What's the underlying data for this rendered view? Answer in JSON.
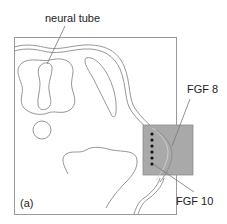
{
  "figure": {
    "panel_label": "(a)",
    "labels": {
      "neural_tube": "neural tube",
      "fgf8": "FGF 8",
      "fgf10": "FGF 10"
    },
    "colors": {
      "line": "#8a8a8a",
      "frame": "#9a9a9a",
      "box_fill": "#a9a9a9",
      "box_stroke": "#8c8c8c",
      "dot": "#111111",
      "text": "#222222"
    },
    "dots_count": 6
  }
}
